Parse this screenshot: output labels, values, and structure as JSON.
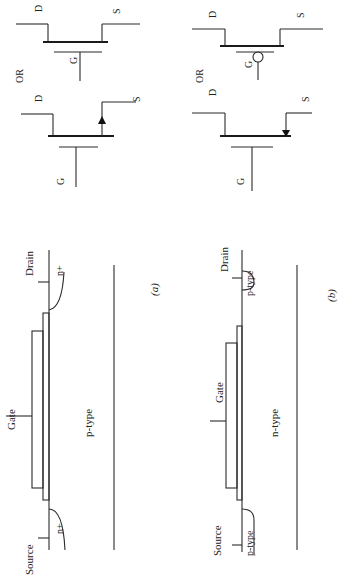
{
  "figure": {
    "orientation": "rotated 90 degrees counter-clockwise",
    "panels": [
      {
        "id": "a",
        "caption": "(a)",
        "cross_section": {
          "gate_label": "Gate",
          "source_label": "Source",
          "drain_label": "Drain",
          "substrate_label": "p-type",
          "source_region_label": "n+",
          "drain_region_label": "n+"
        },
        "symbols": {
          "symbol1": {
            "drain": "D",
            "source": "S",
            "gate": "G",
            "arrow": "outward (up)"
          },
          "or_label": "OR",
          "symbol2": {
            "drain": "D",
            "source": "S",
            "gate": "G",
            "bubble": false
          }
        }
      },
      {
        "id": "b",
        "caption": "(b)",
        "cross_section": {
          "gate_label": "Gate",
          "source_label": "Source",
          "drain_label": "Drain",
          "substrate_label": "n-type",
          "source_region_label": "p-type",
          "drain_region_label": "p-type"
        },
        "symbols": {
          "symbol1": {
            "drain": "D",
            "source": "S",
            "gate": "G",
            "arrow": "inward (down)"
          },
          "or_label": "OR",
          "symbol2": {
            "drain": "D",
            "source": "S",
            "gate": "G",
            "bubble": true
          }
        }
      }
    ]
  }
}
